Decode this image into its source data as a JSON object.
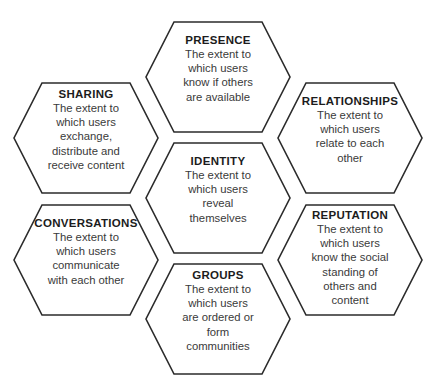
{
  "diagram": {
    "type": "honeycomb-framework",
    "shape": "hexagon",
    "background_color": "#ffffff",
    "outline_color": "#2b2b2b",
    "title_color": "#1c1c1c",
    "body_color": "#3a3a3a",
    "cells": [
      {
        "id": "presence",
        "title": "PRESENCE",
        "lines": [
          "The extent to",
          "which users",
          "know if others",
          "are available"
        ],
        "column": "center",
        "row": "top"
      },
      {
        "id": "sharing",
        "title": "SHARING",
        "lines": [
          "The extent to",
          "which users",
          "exchange,",
          "distribute and",
          "receive content"
        ],
        "column": "left",
        "row": "upper"
      },
      {
        "id": "relationships",
        "title": "RELATIONSHIPS",
        "lines": [
          "The extent to",
          "which users",
          "relate to each",
          "other"
        ],
        "column": "right",
        "row": "upper"
      },
      {
        "id": "identity",
        "title": "IDENTITY",
        "lines": [
          "The extent to",
          "which users",
          "reveal",
          "themselves"
        ],
        "column": "center",
        "row": "middle"
      },
      {
        "id": "conversations",
        "title": "CONVERSATIONS",
        "lines": [
          "The extent to",
          "which users",
          "communicate",
          "with each other"
        ],
        "column": "left",
        "row": "lower"
      },
      {
        "id": "reputation",
        "title": "REPUTATION",
        "lines": [
          "The extent to",
          "which users",
          "know the social",
          "standing of",
          "others and",
          "content"
        ],
        "column": "right",
        "row": "lower"
      },
      {
        "id": "groups",
        "title": "GROUPS",
        "lines": [
          "The extent to",
          "which users",
          "are ordered or",
          "form",
          "communities"
        ],
        "column": "center",
        "row": "bottom"
      }
    ]
  }
}
